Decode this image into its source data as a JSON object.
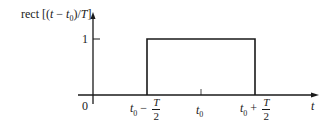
{
  "diagram": {
    "title": "rect [(t − t0)/T]",
    "y_axis_label": {
      "prefix": "rect [(",
      "var": "t",
      "minus": " − ",
      "sub_var": "t",
      "sub_index": "0",
      "close": ")/",
      "T": "T",
      "bracket": "]"
    },
    "y_tick_label": "1",
    "origin_label": "0",
    "x_axis_label": "t",
    "x_ticks": [
      {
        "base": "t",
        "sub": "0",
        "op": " − ",
        "num": "T",
        "den": "2"
      },
      {
        "base": "t",
        "sub": "0"
      },
      {
        "base": "t",
        "sub": "0",
        "op": " + ",
        "num": "T",
        "den": "2"
      }
    ],
    "colors": {
      "stroke": "#1a1a1a",
      "background": "#ffffff"
    }
  }
}
